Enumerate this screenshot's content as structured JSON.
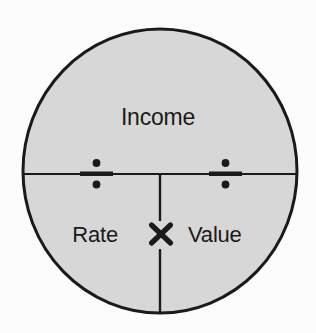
{
  "diagram": {
    "type": "circle-formula-mnemonic",
    "title_text": "Income",
    "background_color": "#fcfcfc",
    "circle": {
      "fill_color": "#d7d7d7",
      "stroke_color": "#1a1a1a",
      "center_x": 160,
      "center_y": 171,
      "radius_x": 138,
      "radius_y": 143,
      "stroke_width": 3
    },
    "labels": {
      "top": "Income",
      "bottom_left": "Rate",
      "bottom_right": "Value"
    },
    "operators": {
      "left_divide": "÷",
      "right_divide": "÷",
      "multiply": "×"
    },
    "operator_positions": {
      "left_divide_x": 96,
      "left_divide_y": 174,
      "right_divide_x": 225,
      "right_divide_y": 174,
      "multiply_x": 160,
      "multiply_y": 235
    },
    "lines": {
      "horizontal_y": 174,
      "vertical_x": 160,
      "line_color": "#1a1a1a"
    },
    "relationships": [
      "Income ÷ Rate = Value",
      "Income ÷ Value = Rate",
      "Rate × Value = Income"
    ]
  }
}
